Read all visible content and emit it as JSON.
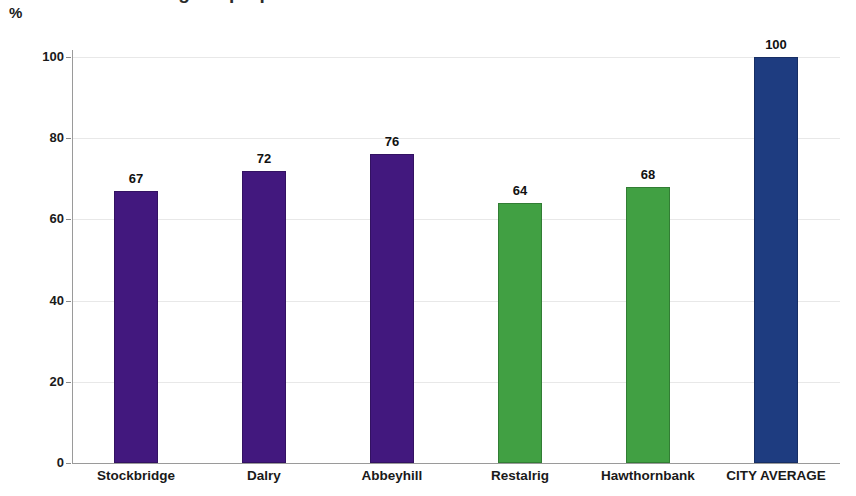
{
  "axis_unit": "%",
  "title_partial": "Percentage of properties",
  "chart_data": {
    "type": "bar",
    "title": "",
    "xlabel": "",
    "ylabel": "%",
    "ylim": [
      0,
      100
    ],
    "yticks": [
      0,
      20,
      40,
      60,
      80,
      100
    ],
    "grid": true,
    "legend": "none",
    "categories": [
      "Stockbridge",
      "Dalry",
      "Abbeyhill",
      "Restalrig",
      "Hawthornbank",
      "CITY AVERAGE"
    ],
    "values": [
      67,
      72,
      76,
      64,
      68,
      100
    ],
    "value_labels": [
      "67",
      "72",
      "76",
      "64",
      "68",
      "100"
    ],
    "colors": [
      "#42187e",
      "#42187e",
      "#42187e",
      "#41a043",
      "#41a043",
      "#1e3c80"
    ],
    "series": [
      {
        "name": "Percentage",
        "values": [
          67,
          72,
          76,
          64,
          68,
          100
        ]
      }
    ],
    "points": [
      {
        "category": "Stockbridge",
        "value": 67,
        "label": "67",
        "color": "#42187e"
      },
      {
        "category": "Dalry",
        "value": 72,
        "label": "72",
        "color": "#42187e"
      },
      {
        "category": "Abbeyhill",
        "value": 76,
        "label": "76",
        "color": "#42187e"
      },
      {
        "category": "Restalrig",
        "value": 64,
        "label": "64",
        "color": "#41a043"
      },
      {
        "category": "Hawthornbank",
        "value": 68,
        "label": "68",
        "color": "#41a043"
      },
      {
        "category": "CITY AVERAGE",
        "value": 100,
        "label": "100",
        "color": "#1e3c80"
      }
    ]
  },
  "palette": {
    "purple": "#42187e",
    "green": "#41a043",
    "navy": "#1e3c80",
    "gridline": "#e8e8e8",
    "axis": "#9a9a9a",
    "text": "#1a1a1a",
    "background": "#ffffff"
  }
}
